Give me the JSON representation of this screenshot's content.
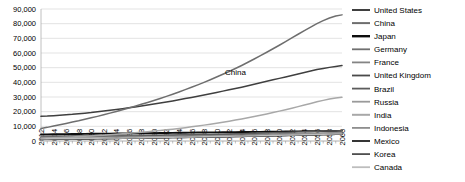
{
  "chart_data": {
    "type": "line",
    "title": "",
    "xlabel": "",
    "ylabel": "",
    "ylim": [
      0,
      90000
    ],
    "ytick_step": 10000,
    "ytick_labels": [
      "90,000",
      "80,000",
      "70,000",
      "60,000",
      "50,000",
      "40,000",
      "30,000",
      "20,000",
      "10,000",
      "0"
    ],
    "grid": true,
    "legend_position": "right",
    "annotations": [
      {
        "text": "China",
        "x": 2043,
        "y": 45000
      }
    ],
    "x": [
      2012,
      2013,
      2014,
      2015,
      2016,
      2017,
      2018,
      2019,
      2020,
      2021,
      2022,
      2023,
      2024,
      2025,
      2026,
      2027,
      2028,
      2029,
      2030,
      2031,
      2032,
      2033,
      2034,
      2035,
      2036,
      2037,
      2038,
      2039,
      2040,
      2041,
      2042,
      2043,
      2044,
      2045,
      2046,
      2047,
      2048,
      2049,
      2050,
      2051,
      2052,
      2053,
      2054,
      2055,
      2056,
      2057,
      2058,
      2059,
      2060
    ],
    "xtick_labels": [
      "2012",
      "2014",
      "2016",
      "2018",
      "2020",
      "2022",
      "2024",
      "2026",
      "2028",
      "2030",
      "2032",
      "2034",
      "2036",
      "2038",
      "2040",
      "2042",
      "2044",
      "2046",
      "2048",
      "2050",
      "2052",
      "2054",
      "2056",
      "2058",
      "2060"
    ],
    "series": [
      {
        "name": "United States",
        "color": "#3f3f3f",
        "width": 1.5,
        "values": [
          16800,
          17000,
          17300,
          17600,
          17900,
          18200,
          18600,
          19000,
          19400,
          19900,
          20400,
          20900,
          21400,
          22000,
          22600,
          23200,
          23800,
          24500,
          25200,
          25900,
          26600,
          27300,
          28100,
          28900,
          29700,
          30500,
          31300,
          32200,
          33100,
          34000,
          34900,
          35800,
          36700,
          37700,
          38700,
          39700,
          40700,
          41700,
          42700,
          43700,
          44700,
          45700,
          46700,
          47700,
          48700,
          49500,
          50200,
          50800,
          51400
        ]
      },
      {
        "name": "China",
        "color": "#6e6e6e",
        "width": 1.5,
        "values": [
          8500,
          9300,
          10200,
          11100,
          12000,
          12900,
          13800,
          14800,
          15800,
          16800,
          17900,
          19000,
          20100,
          21300,
          22500,
          23700,
          25000,
          26300,
          27600,
          29000,
          30400,
          31900,
          33400,
          35000,
          36600,
          38300,
          40000,
          41800,
          43600,
          45500,
          47400,
          49400,
          51500,
          53700,
          55900,
          58200,
          60500,
          62900,
          65300,
          67800,
          70300,
          72800,
          75300,
          77700,
          80000,
          82100,
          83900,
          85200,
          86000
        ]
      },
      {
        "name": "Japan",
        "color": "#0d0d0d",
        "width": 1.9,
        "values": [
          4500,
          4550,
          4600,
          4650,
          4700,
          4750,
          4800,
          4850,
          4900,
          4950,
          5000,
          5050,
          5100,
          5150,
          5200,
          5250,
          5300,
          5350,
          5400,
          5450,
          5500,
          5550,
          5600,
          5650,
          5700,
          5750,
          5800,
          5850,
          5900,
          5950,
          6000,
          6050,
          6100,
          6150,
          6200,
          6250,
          6300,
          6350,
          6400,
          6450,
          6500,
          6550,
          6600,
          6650,
          6700,
          6750,
          6800,
          6850,
          6900
        ]
      },
      {
        "name": "Germany",
        "color": "#707070",
        "width": 1.3,
        "values": [
          3400,
          3440,
          3480,
          3520,
          3560,
          3600,
          3640,
          3680,
          3720,
          3760,
          3800,
          3840,
          3880,
          3920,
          3960,
          4000,
          4040,
          4080,
          4120,
          4160,
          4200,
          4240,
          4280,
          4320,
          4360,
          4400,
          4440,
          4480,
          4520,
          4560,
          4600,
          4640,
          4680,
          4720,
          4760,
          4800,
          4840,
          4880,
          4920,
          4960,
          5000,
          5040,
          5080,
          5120,
          5160,
          5200,
          5240,
          5280,
          5320
        ]
      },
      {
        "name": "France",
        "color": "#848484",
        "width": 1.3,
        "values": [
          2600,
          2640,
          2680,
          2720,
          2760,
          2800,
          2840,
          2880,
          2920,
          2960,
          3000,
          3040,
          3080,
          3120,
          3160,
          3200,
          3240,
          3280,
          3320,
          3360,
          3400,
          3440,
          3480,
          3520,
          3560,
          3600,
          3640,
          3680,
          3720,
          3760,
          3800,
          3840,
          3880,
          3920,
          3960,
          4000,
          4040,
          4080,
          4120,
          4160,
          4200,
          4240,
          4280,
          4320,
          4360,
          4400,
          4440,
          4480,
          4520
        ]
      },
      {
        "name": "United Kingdom",
        "color": "#4a4a4a",
        "width": 1.3,
        "values": [
          2500,
          2545,
          2590,
          2635,
          2680,
          2725,
          2770,
          2815,
          2860,
          2905,
          2950,
          2995,
          3040,
          3085,
          3130,
          3175,
          3220,
          3265,
          3310,
          3355,
          3400,
          3450,
          3500,
          3550,
          3600,
          3650,
          3700,
          3750,
          3800,
          3850,
          3900,
          3950,
          4000,
          4050,
          4100,
          4150,
          4200,
          4250,
          4300,
          4350,
          4400,
          4450,
          4500,
          4550,
          4600,
          4650,
          4700,
          4750,
          4800
        ]
      },
      {
        "name": "Brazil",
        "color": "#5c5c5c",
        "width": 1.3,
        "values": [
          2400,
          2450,
          2500,
          2560,
          2620,
          2680,
          2740,
          2800,
          2870,
          2940,
          3010,
          3080,
          3150,
          3230,
          3310,
          3390,
          3470,
          3550,
          3640,
          3730,
          3820,
          3910,
          4000,
          4100,
          4200,
          4300,
          4400,
          4500,
          4610,
          4720,
          4830,
          4940,
          5050,
          5170,
          5290,
          5410,
          5530,
          5650,
          5780,
          5910,
          6040,
          6170,
          6300,
          6430,
          6560,
          6690,
          6820,
          6950,
          7080
        ]
      },
      {
        "name": "Russia",
        "color": "#9a9a9a",
        "width": 1.3,
        "values": [
          2000,
          2050,
          2100,
          2150,
          2200,
          2250,
          2300,
          2355,
          2410,
          2465,
          2520,
          2575,
          2630,
          2690,
          2750,
          2810,
          2870,
          2930,
          2990,
          3050,
          3110,
          3170,
          3230,
          3290,
          3350,
          3410,
          3470,
          3530,
          3590,
          3650,
          3710,
          3770,
          3830,
          3890,
          3950,
          4010,
          4070,
          4130,
          4190,
          4250,
          4310,
          4370,
          4430,
          4490,
          4550,
          4610,
          4670,
          4730,
          4790
        ]
      },
      {
        "name": "India",
        "color": "#a8a8a8",
        "width": 1.5,
        "values": [
          1900,
          2050,
          2220,
          2400,
          2590,
          2790,
          3000,
          3230,
          3470,
          3720,
          3990,
          4270,
          4570,
          4890,
          5220,
          5570,
          5940,
          6330,
          6740,
          7170,
          7620,
          8090,
          8590,
          9110,
          9660,
          10230,
          10830,
          11460,
          12120,
          12810,
          13530,
          14280,
          15060,
          15870,
          16710,
          17580,
          18480,
          19410,
          20370,
          21360,
          22380,
          23430,
          24510,
          25620,
          26700,
          27700,
          28600,
          29300,
          29800
        ]
      },
      {
        "name": "Indonesia",
        "color": "#8e8e8e",
        "width": 1.3,
        "values": [
          900,
          950,
          1000,
          1055,
          1110,
          1170,
          1230,
          1295,
          1360,
          1430,
          1500,
          1575,
          1650,
          1730,
          1810,
          1895,
          1980,
          2070,
          2160,
          2255,
          2350,
          2450,
          2550,
          2655,
          2760,
          2870,
          2980,
          3095,
          3210,
          3330,
          3450,
          3575,
          3700,
          3830,
          3960,
          4095,
          4230,
          4370,
          4510,
          4655,
          4800,
          4950,
          5100,
          5255,
          5410,
          5570,
          5730,
          5890,
          6050
        ]
      },
      {
        "name": "Mexico",
        "color": "#1f1f1f",
        "width": 1.3,
        "values": [
          1200,
          1235,
          1270,
          1310,
          1350,
          1390,
          1430,
          1475,
          1520,
          1565,
          1610,
          1660,
          1710,
          1760,
          1815,
          1870,
          1925,
          1985,
          2045,
          2105,
          2170,
          2235,
          2300,
          2370,
          2440,
          2510,
          2585,
          2660,
          2735,
          2815,
          2895,
          2975,
          3060,
          3145,
          3230,
          3320,
          3410,
          3500,
          3595,
          3690,
          3785,
          3885,
          3985,
          4085,
          4190,
          4295,
          4400,
          4505,
          4610
        ]
      },
      {
        "name": "Korea",
        "color": "#4f4f4f",
        "width": 1.3,
        "values": [
          1200,
          1240,
          1280,
          1325,
          1370,
          1415,
          1460,
          1510,
          1560,
          1610,
          1660,
          1715,
          1770,
          1825,
          1885,
          1945,
          2005,
          2065,
          2130,
          2195,
          2260,
          2325,
          2395,
          2465,
          2535,
          2605,
          2680,
          2755,
          2830,
          2905,
          2985,
          3065,
          3145,
          3225,
          3310,
          3395,
          3480,
          3565,
          3655,
          3745,
          3835,
          3925,
          4020,
          4115,
          4210,
          4305,
          4400,
          4495,
          4590
        ]
      },
      {
        "name": "Canada",
        "color": "#bdbdbd",
        "width": 1.3,
        "values": [
          1500,
          1535,
          1570,
          1610,
          1650,
          1690,
          1730,
          1775,
          1820,
          1865,
          1910,
          1960,
          2010,
          2060,
          2115,
          2170,
          2225,
          2285,
          2345,
          2405,
          2470,
          2535,
          2600,
          2670,
          2740,
          2810,
          2885,
          2960,
          3035,
          3115,
          3195,
          3275,
          3360,
          3445,
          3530,
          3620,
          3710,
          3800,
          3895,
          3990,
          4085,
          4185,
          4285,
          4385,
          4490,
          4595,
          4700,
          4805,
          4910
        ]
      }
    ]
  },
  "legend": {
    "items": [
      {
        "label": "United States"
      },
      {
        "label": "China"
      },
      {
        "label": "Japan"
      },
      {
        "label": "Germany"
      },
      {
        "label": "France"
      },
      {
        "label": "United Kingdom"
      },
      {
        "label": "Brazil"
      },
      {
        "label": "Russia"
      },
      {
        "label": "India"
      },
      {
        "label": "Indonesia"
      },
      {
        "label": "Mexico"
      },
      {
        "label": "Korea"
      },
      {
        "label": "Canada"
      }
    ]
  }
}
